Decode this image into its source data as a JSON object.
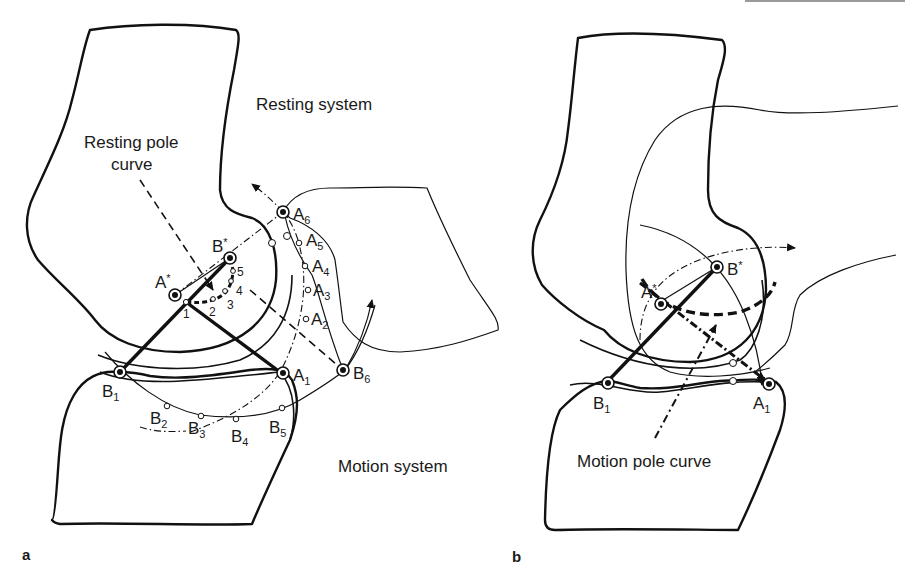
{
  "figure": {
    "top_bar_color": "#9a9a9a",
    "panels": [
      {
        "id": "a",
        "panel_label": "a",
        "region_labels": {
          "resting_system": "Resting system",
          "motion_system": "Motion system",
          "resting_pole_curve_line1": "Resting pole",
          "resting_pole_curve_line2": "curve"
        },
        "points": {
          "a_star": {
            "base": "A",
            "mark": "*"
          },
          "b_star": {
            "base": "B",
            "mark": "*"
          },
          "a1": {
            "base": "A",
            "sub": "1"
          },
          "a2": {
            "base": "A",
            "sub": "2"
          },
          "a3": {
            "base": "A",
            "sub": "3"
          },
          "a4": {
            "base": "A",
            "sub": "4"
          },
          "a5": {
            "base": "A",
            "sub": "5"
          },
          "a6": {
            "base": "A",
            "sub": "6"
          },
          "b1": {
            "base": "B",
            "sub": "1"
          },
          "b2": {
            "base": "B",
            "sub": "2"
          },
          "b3": {
            "base": "B",
            "sub": "3"
          },
          "b4": {
            "base": "B",
            "sub": "4"
          },
          "b5": {
            "base": "B",
            "sub": "5"
          },
          "b6": {
            "base": "B",
            "sub": "6"
          }
        },
        "pole_numbers": [
          "1",
          "2",
          "3",
          "4",
          "5"
        ]
      },
      {
        "id": "b",
        "panel_label": "b",
        "region_labels": {
          "motion_pole_curve": "Motion pole curve"
        },
        "points": {
          "a_star": {
            "base": "A",
            "mark": "*"
          },
          "b_star": {
            "base": "B",
            "mark": "*"
          },
          "a1": {
            "base": "A",
            "sub": "1"
          },
          "b1": {
            "base": "B",
            "sub": "1"
          }
        }
      }
    ]
  }
}
